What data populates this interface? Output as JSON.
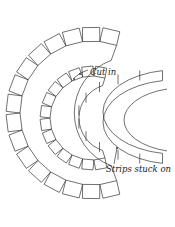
{
  "labels": {
    "cut_in": "Cut in",
    "strips_stuck_on": "Strips stuck on"
  },
  "colors": {
    "line": "#333333",
    "background": "#ffffff"
  }
}
